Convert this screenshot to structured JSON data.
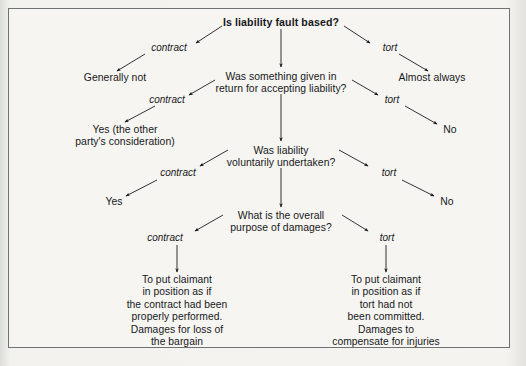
{
  "diagram": {
    "type": "decision-tree",
    "title": "Is liability fault based?",
    "orientation": "top-down",
    "branch_label_contract": "contract",
    "branch_label_tort": "tort",
    "levels": [
      {
        "question": "Is liability fault based?",
        "bold": true,
        "contract_outcome": "Generally not",
        "tort_outcome": "Almost always",
        "center_child": "Was something given in\nreturn for accepting liability?"
      },
      {
        "question": "Was something given in\nreturn for accepting liability?",
        "contract_outcome": "Yes (the other\nparty's consideration)",
        "tort_outcome": "No",
        "center_child": "Was liability\nvoluntarily undertaken?"
      },
      {
        "question": "Was liability\nvoluntarily undertaken?",
        "contract_outcome": "Yes",
        "tort_outcome": "No",
        "center_child": "What is the overall\npurpose of damages?"
      },
      {
        "question": "What is the overall\npurpose of damages?",
        "contract_outcome": "To put claimant\nin position as if\nthe contract had been\nproperly performed.\nDamages for loss of\nthe bargain",
        "tort_outcome": "To put claimant\nin position as if\ntort had not\nbeen committed.\nDamages to\ncompensate for injuries",
        "center_child": null
      }
    ],
    "nodes": {
      "q1": "Is liability fault based?",
      "q1_contract_label": "contract",
      "q1_tort_label": "tort",
      "generally_not": "Generally not",
      "almost_always": "Almost always",
      "q2": "Was something given in\nreturn for accepting liability?",
      "q2_contract_label": "contract",
      "q2_tort_label": "tort",
      "yes_consideration": "Yes (the other\nparty's consideration)",
      "no_1": "No",
      "q3": "Was liability\nvoluntarily undertaken?",
      "q3_contract_label": "contract",
      "q3_tort_label": "tort",
      "yes_2": "Yes",
      "no_2": "No",
      "q4": "What is the overall\npurpose of damages?",
      "q4_contract_label": "contract",
      "q4_tort_label": "tort",
      "contract_damages": "To put claimant\nin position as if\nthe contract had been\nproperly performed.\nDamages for loss of\nthe bargain",
      "tort_damages": "To put claimant\nin position as if\ntort had not\nbeen committed.\nDamages to\ncompensate for injuries"
    },
    "colors": {
      "text": "#16181a",
      "line": "#1a1c1e",
      "frame": "#6f7272",
      "page": "#f6f5f2"
    }
  }
}
